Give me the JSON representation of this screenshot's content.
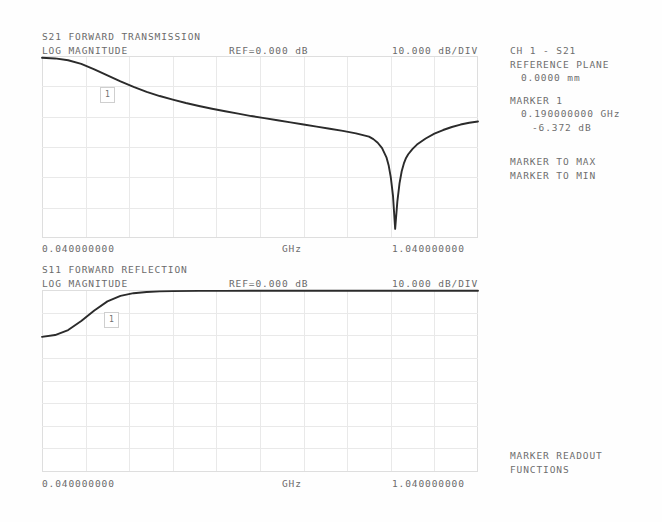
{
  "instrument": {
    "kind": "vector-network-analyzer-screen"
  },
  "channels": [
    {
      "id": "s21",
      "title": "S21 FORWARD TRANSMISSION",
      "format": "LOG MAGNITUDE",
      "reference": "REF=0.000 dB",
      "scale": "10.000 dB/DIV",
      "start_label": "0.040000000",
      "unit_label": "GHz",
      "stop_label": "1.040000000",
      "marker_flag": "1"
    },
    {
      "id": "s11",
      "title": "S11 FORWARD REFLECTION",
      "format": "LOG MAGNITUDE",
      "reference": "REF=0.000 dB",
      "scale": "10.000 dB/DIV",
      "start_label": "0.040000000",
      "unit_label": "GHz",
      "stop_label": "1.040000000",
      "marker_flag": "1"
    }
  ],
  "sidebar": {
    "channel_line": "CH 1 - S21",
    "reference_plane_label": "REFERENCE PLANE",
    "reference_plane_value": "0.0000 mm",
    "marker_label": "MARKER 1",
    "marker_freq": "0.190000000 GHz",
    "marker_mag": "-6.372 dB",
    "softkeys": [
      "MARKER TO MAX",
      "MARKER TO MIN"
    ],
    "footer": [
      "MARKER READOUT",
      "FUNCTIONS"
    ]
  },
  "colors": {
    "background": "#ffffff",
    "grid": "#e9e9e9",
    "grid_edge": "#dedede",
    "trace": "#2b2b2b",
    "text": "#6b6b6b"
  },
  "chart_data": [
    {
      "type": "line",
      "id": "s21-log-magnitude",
      "title": "S21 FORWARD TRANSMISSION",
      "subtitle": "LOG MAGNITUDE",
      "xlabel": "GHz",
      "ylabel": "dB",
      "xlim": [
        0.04,
        1.04
      ],
      "ylim": [
        -60,
        0
      ],
      "reference_level_db": 0.0,
      "scale_db_per_div": 10.0,
      "x_divisions": 10,
      "y_divisions": 6,
      "grid": true,
      "legend": "none",
      "annotations": [
        {
          "text": "1",
          "type": "marker-flag",
          "x": 0.19,
          "y": -6.372
        }
      ],
      "markers": [
        {
          "id": 1,
          "freq_ghz": 0.19,
          "value_db": -6.372
        }
      ],
      "x": [
        0.04,
        0.07,
        0.1,
        0.13,
        0.16,
        0.19,
        0.22,
        0.25,
        0.28,
        0.31,
        0.34,
        0.37,
        0.4,
        0.43,
        0.46,
        0.49,
        0.52,
        0.55,
        0.58,
        0.61,
        0.64,
        0.67,
        0.7,
        0.73,
        0.76,
        0.79,
        0.8,
        0.81,
        0.82,
        0.83,
        0.835,
        0.84,
        0.845,
        0.85,
        0.855,
        0.86,
        0.865,
        0.87,
        0.875,
        0.88,
        0.89,
        0.9,
        0.92,
        0.94,
        0.96,
        0.98,
        1.0,
        1.02,
        1.04
      ],
      "y": [
        -0.6,
        -0.8,
        -1.4,
        -2.6,
        -4.4,
        -6.4,
        -8.4,
        -10.2,
        -11.8,
        -13.2,
        -14.4,
        -15.5,
        -16.5,
        -17.4,
        -18.2,
        -19.0,
        -19.8,
        -20.5,
        -21.2,
        -21.9,
        -22.6,
        -23.3,
        -24.0,
        -24.7,
        -25.5,
        -26.6,
        -27.4,
        -28.6,
        -30.4,
        -33.4,
        -36.0,
        -40.0,
        -46.0,
        -57.0,
        -48.0,
        -42.0,
        -38.0,
        -35.4,
        -33.6,
        -32.4,
        -30.6,
        -29.2,
        -27.2,
        -25.6,
        -24.4,
        -23.4,
        -22.6,
        -22.0,
        -21.6
      ]
    },
    {
      "type": "line",
      "id": "s11-log-magnitude",
      "title": "S11 FORWARD REFLECTION",
      "subtitle": "LOG MAGNITUDE",
      "xlabel": "GHz",
      "ylabel": "dB",
      "xlim": [
        0.04,
        1.04
      ],
      "ylim": [
        -80,
        0
      ],
      "reference_level_db": 0.0,
      "scale_db_per_div": 10.0,
      "x_divisions": 10,
      "y_divisions": 8,
      "grid": true,
      "legend": "none",
      "annotations": [
        {
          "text": "1",
          "type": "marker-flag",
          "x": 0.19,
          "y": -0.6
        }
      ],
      "x": [
        0.04,
        0.07,
        0.1,
        0.13,
        0.16,
        0.19,
        0.22,
        0.25,
        0.28,
        0.31,
        0.34,
        0.4,
        0.46,
        0.52,
        0.58,
        0.64,
        0.7,
        0.76,
        0.82,
        0.88,
        0.94,
        1.0,
        1.04
      ],
      "y": [
        -20.6,
        -19.8,
        -17.6,
        -13.6,
        -9.0,
        -5.0,
        -2.6,
        -1.4,
        -0.9,
        -0.6,
        -0.5,
        -0.4,
        -0.4,
        -0.35,
        -0.35,
        -0.3,
        -0.3,
        -0.3,
        -0.3,
        -0.3,
        -0.3,
        -0.3,
        -0.3
      ]
    }
  ]
}
